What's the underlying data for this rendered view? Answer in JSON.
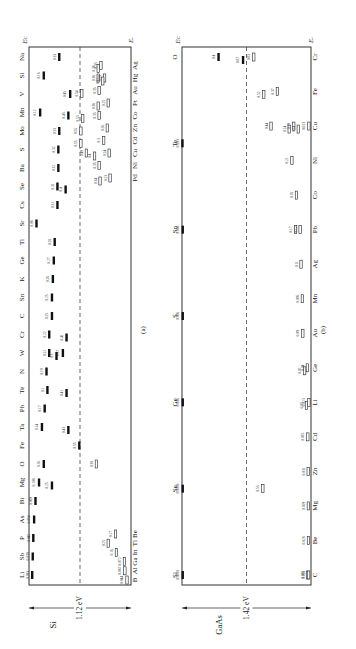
{
  "figure": {
    "orientation": "rotated-90-ccw",
    "panels": [
      {
        "id": "a",
        "caption": "(a)",
        "material": "Si",
        "bandgap_label": "1.12 eV",
        "ec_label": "E_C",
        "ev_label": "E_V",
        "top_elements": [
          "Li",
          "Sb",
          "P",
          "As",
          "Bi",
          "Mg",
          "O",
          "Fe",
          "Ta",
          "Pb",
          "Te",
          "N",
          "W",
          "Cr",
          "C",
          "Sn",
          "K",
          "Ge",
          "Ti",
          "Sr",
          "Cs",
          "Se",
          "Ba",
          "S",
          "Mo",
          "Mn",
          "V",
          "Si",
          "Na"
        ],
        "bottom_elements_left": [
          "B",
          "Al",
          "Ga",
          "In",
          "Tl",
          "Be"
        ],
        "bottom_elements_right": [
          "Pd",
          "Ni",
          "Cu",
          "Cd",
          "Zn",
          "Co",
          "Pt",
          "Au",
          "Hg",
          "Ag"
        ]
      },
      {
        "id": "b",
        "caption": "(b)",
        "material": "GaAs",
        "bandgap_label": "1.42 eV",
        "ec_label": "E_C",
        "ev_label": "E_V",
        "top_elements": [
          "Si",
          "Se",
          "Ge",
          "S",
          "Sn",
          "Te",
          "O"
        ],
        "bottom_elements": [
          "C",
          "Be",
          "Mg",
          "Zn",
          "Cd",
          "Li",
          "Ge",
          "Au",
          "Mn",
          "Ag",
          "Pb",
          "Co",
          "Ni",
          "Cu",
          "Fe",
          "Cr"
        ]
      }
    ]
  },
  "chart_data": [
    {
      "type": "table",
      "title": "Impurity energy levels in Si (eV, measured from nearest band edge)",
      "material": "Si",
      "bandgap_eV": 1.12,
      "levels": [
        {
          "element": "Li",
          "donor": [
            0.033
          ]
        },
        {
          "element": "Sb",
          "donor": [
            0.039
          ]
        },
        {
          "element": "P",
          "donor": [
            0.045
          ]
        },
        {
          "element": "As",
          "donor": [
            0.054
          ]
        },
        {
          "element": "Bi",
          "donor": [
            0.069
          ]
        },
        {
          "element": "Mg",
          "donor": [
            0.108,
            0.25
          ]
        },
        {
          "element": "O",
          "donor": [
            0.16
          ],
          "acceptor": [
            0.38
          ]
        },
        {
          "element": "Fe",
          "donor": [
            0.55
          ]
        },
        {
          "element": "Ta",
          "donor": [
            0.14,
            0.43
          ]
        },
        {
          "element": "Pb",
          "donor": [
            0.17
          ]
        },
        {
          "element": "Te",
          "donor": [
            0.2,
            0.41
          ]
        },
        {
          "element": "N",
          "donor": [
            0.19
          ]
        },
        {
          "element": "W",
          "donor": [
            0.22,
            0.3,
            0.37
          ]
        },
        {
          "element": "Cr",
          "donor": [
            0.22,
            0.41
          ]
        },
        {
          "element": "C",
          "donor": [
            0.25
          ]
        },
        {
          "element": "Sn",
          "donor": [
            0.25
          ]
        },
        {
          "element": "K",
          "donor": [
            0.26
          ]
        },
        {
          "element": "Ge",
          "donor": [
            0.27
          ]
        },
        {
          "element": "Ti",
          "donor": [
            0.28
          ]
        },
        {
          "element": "Sr",
          "donor": [
            0.08
          ]
        },
        {
          "element": "Cs",
          "donor": [
            0.31
          ]
        },
        {
          "element": "Se",
          "donor": [
            0.31,
            0.4
          ]
        },
        {
          "element": "Ba",
          "donor": [
            0.32
          ]
        },
        {
          "element": "S",
          "donor": [
            0.32
          ]
        },
        {
          "element": "Mo",
          "donor": [
            0.33
          ]
        },
        {
          "element": "Mn",
          "donor": [
            0.12,
            0.43
          ]
        },
        {
          "element": "V",
          "donor": [
            0.45
          ]
        },
        {
          "element": "Si",
          "donor": [
            0.16
          ]
        },
        {
          "element": "Na",
          "donor": [
            0.33
          ]
        },
        {
          "element": "B",
          "acceptor": [
            0.044
          ]
        },
        {
          "element": "Al",
          "acceptor": [
            0.067
          ]
        },
        {
          "element": "Ga",
          "acceptor": [
            0.072
          ]
        },
        {
          "element": "In",
          "acceptor": [
            0.16
          ]
        },
        {
          "element": "Tl",
          "acceptor": [
            0.25
          ]
        },
        {
          "element": "Be",
          "acceptor": [
            0.17
          ]
        },
        {
          "element": "Pd",
          "acceptor": [
            0.23,
            0.34
          ]
        },
        {
          "element": "Ni",
          "acceptor": [
            0.35
          ]
        },
        {
          "element": "Cu",
          "acceptor": [
            0.24,
            0.4,
            0.49
          ]
        },
        {
          "element": "Cd",
          "acceptor": [
            0.3,
            0.55
          ]
        },
        {
          "element": "Zn",
          "acceptor": [
            0.26,
            0.55
          ]
        },
        {
          "element": "Co",
          "acceptor": [
            0.35,
            0.53
          ]
        },
        {
          "element": "Pt",
          "acceptor": [
            0.25,
            0.36
          ]
        },
        {
          "element": "Au",
          "acceptor": [
            0.35,
            0.54
          ]
        },
        {
          "element": "Hg",
          "acceptor": [
            0.29,
            0.31,
            0.36
          ]
        },
        {
          "element": "Ag",
          "acceptor": [
            0.33,
            0.36
          ]
        }
      ]
    },
    {
      "type": "table",
      "title": "Impurity energy levels in GaAs (eV)",
      "material": "GaAs",
      "bandgap_eV": 1.42,
      "levels": [
        {
          "element": "Si",
          "donor": [
            0.0058
          ],
          "acceptor": [
            0.035
          ]
        },
        {
          "element": "Se",
          "donor": [
            0.0059
          ],
          "acceptor": [
            0.53
          ]
        },
        {
          "element": "Ge",
          "donor": [
            0.006
          ]
        },
        {
          "element": "S",
          "donor": [
            0.006
          ]
        },
        {
          "element": "Sn",
          "donor": [
            0.006
          ],
          "acceptor": [
            0.17
          ]
        },
        {
          "element": "Te",
          "donor": [
            0.003
          ]
        },
        {
          "element": "O",
          "donor": [
            0.4,
            0.67
          ]
        },
        {
          "element": "C",
          "acceptor": [
            0.026
          ]
        },
        {
          "element": "Be",
          "acceptor": [
            0.028
          ]
        },
        {
          "element": "Mg",
          "acceptor": [
            0.029
          ]
        },
        {
          "element": "Zn",
          "acceptor": [
            0.031
          ]
        },
        {
          "element": "Cd",
          "acceptor": [
            0.035
          ]
        },
        {
          "element": "Li",
          "acceptor": [
            0.023,
            0.05
          ]
        },
        {
          "element": "Ge",
          "acceptor": [
            0.04,
            0.07
          ]
        },
        {
          "element": "Au",
          "acceptor": [
            0.09
          ]
        },
        {
          "element": "Mn",
          "acceptor": [
            0.095
          ]
        },
        {
          "element": "Ag",
          "acceptor": [
            0.11
          ]
        },
        {
          "element": "Pb",
          "acceptor": [
            0.12
          ]
        },
        {
          "element": "Co",
          "acceptor": [
            0.16
          ]
        },
        {
          "element": "Ni",
          "acceptor": [
            0.21
          ]
        },
        {
          "element": "Cu",
          "acceptor": [
            0.023,
            0.14,
            0.19,
            0.24,
            0.44
          ]
        },
        {
          "element": "Fe",
          "acceptor": [
            0.37,
            0.52
          ]
        },
        {
          "element": "Cr",
          "acceptor": [
            0.63
          ]
        }
      ]
    }
  ]
}
